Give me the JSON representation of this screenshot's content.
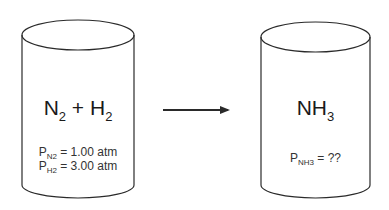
{
  "diagram": {
    "type": "reaction-schematic",
    "left_container": {
      "shape": "cylinder",
      "formula": {
        "a": "N",
        "a_sub": "2",
        "op": " + ",
        "b": "H",
        "b_sub": "2"
      },
      "pressures": [
        {
          "symbol": "P",
          "sub": "N2",
          "value": " = 1.00 atm"
        },
        {
          "symbol": "P",
          "sub": "H2",
          "value": " = 3.00 atm"
        }
      ]
    },
    "arrow": {
      "direction": "right"
    },
    "right_container": {
      "shape": "cylinder",
      "formula": {
        "a": "NH",
        "a_sub": "3"
      },
      "pressures": [
        {
          "symbol": "P",
          "sub": "NH3",
          "value": " = ??"
        }
      ]
    },
    "colors": {
      "stroke": "#2a2a2a",
      "text": "#1a1a1a",
      "background": "#ffffff"
    }
  }
}
